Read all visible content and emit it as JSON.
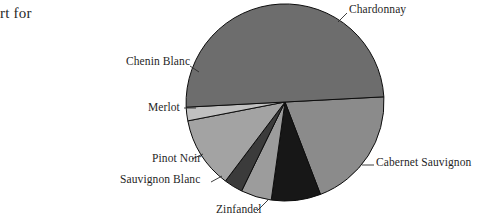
{
  "caption": {
    "fragment_text": "rt for"
  },
  "chart_data": {
    "type": "pie",
    "title": "",
    "subtitle": "",
    "xlabel": "",
    "ylabel": "",
    "legend_position": "none",
    "label_style": "leader-lines",
    "grid": false,
    "center": {
      "x": 285,
      "y": 102
    },
    "radius": 99,
    "start_angle_deg": -3,
    "direction": "clockwise",
    "categories": [
      "Cabernet Sauvignon",
      "Zinfandel",
      "Sauvignon Blanc",
      "Pinot Noir",
      "Merlot",
      "Chenin Blanc",
      "Chardonnay"
    ],
    "values": [
      20,
      8,
      5,
      3,
      12,
      2,
      50
    ],
    "slices": [
      {
        "label": "Cabernet Sauvignon",
        "value": 20,
        "percent": 20,
        "color": "#8b8b8b",
        "start_deg": -3,
        "end_deg": 69,
        "leader": {
          "x1": 362,
          "y1": 165,
          "x2": 374,
          "y2": 165
        }
      },
      {
        "label": "Zinfandel",
        "value": 8,
        "percent": 8,
        "color": "#171717",
        "start_deg": 69,
        "end_deg": 98,
        "leader": {
          "x1": 269,
          "y1": 199,
          "x2": 257,
          "y2": 211
        }
      },
      {
        "label": "Sauvignon Blanc",
        "value": 5,
        "percent": 5,
        "color": "#9c9c9c",
        "start_deg": 98,
        "end_deg": 116,
        "leader": {
          "x1": 222,
          "y1": 176,
          "x2": 211,
          "y2": 182
        }
      },
      {
        "label": "Pinot Noir",
        "value": 3,
        "percent": 3,
        "color": "#3b3b3b",
        "start_deg": 116,
        "end_deg": 127,
        "leader": {
          "x1": 203,
          "y1": 154,
          "x2": 192,
          "y2": 159
        }
      },
      {
        "label": "Merlot",
        "value": 12,
        "percent": 12,
        "color": "#a3a3a3",
        "start_deg": 127,
        "end_deg": 169,
        "leader": {
          "x1": 196,
          "y1": 108,
          "x2": 184,
          "y2": 108
        }
      },
      {
        "label": "Chenin Blanc",
        "value": 2,
        "percent": 2,
        "color": "#c0c0c0",
        "start_deg": 169,
        "end_deg": 177,
        "leader": {
          "x1": 199,
          "y1": 72,
          "x2": 190,
          "y2": 66
        }
      },
      {
        "label": "Chardonnay",
        "value": 50,
        "percent": 50,
        "color": "#6d6d6d",
        "start_deg": 177,
        "end_deg": 357,
        "leader": {
          "x1": 338,
          "y1": 22,
          "x2": 347,
          "y2": 13
        }
      }
    ]
  }
}
